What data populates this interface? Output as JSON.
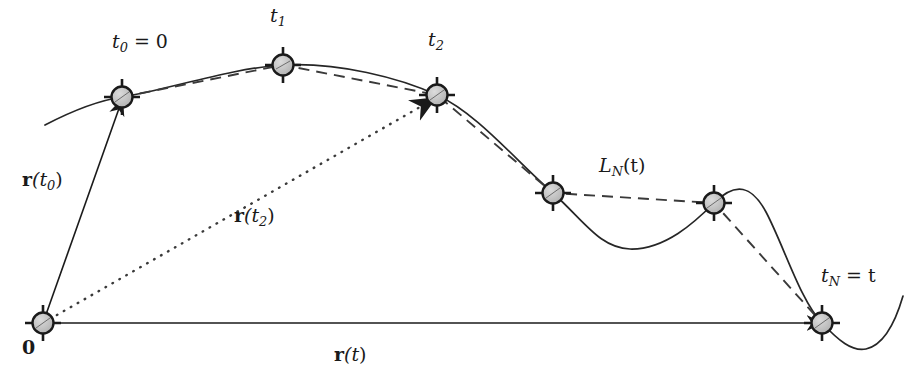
{
  "figure": {
    "type": "vector-trajectory-diagram",
    "canvas": {
      "width": 908,
      "height": 378
    },
    "colors": {
      "curve": "#262626",
      "dashed": "#3a3a3a",
      "dotted": "#3a3a3a",
      "node_fill": "#c0c0c0",
      "node_ring": "#1a1a1a",
      "text": "#1a1a1a",
      "background": "#ffffff"
    },
    "nodes": [
      {
        "name": "origin",
        "x": 43,
        "y": 323,
        "label": "0"
      },
      {
        "name": "t0",
        "x": 122,
        "y": 97,
        "label": "t0 = 0"
      },
      {
        "name": "t1",
        "x": 283,
        "y": 65,
        "label": "t1"
      },
      {
        "name": "t2",
        "x": 437,
        "y": 95,
        "label": "t2"
      },
      {
        "name": "t3",
        "x": 553,
        "y": 193,
        "label": ""
      },
      {
        "name": "t4",
        "x": 714,
        "y": 203,
        "label": ""
      },
      {
        "name": "tN",
        "x": 822,
        "y": 323,
        "label": "tN = t"
      }
    ],
    "vectors": [
      {
        "name": "r-t0",
        "style": "solid",
        "from": "origin",
        "to": "t0",
        "label": "r(t0)"
      },
      {
        "name": "r-t2",
        "style": "dotted",
        "from": "origin",
        "to": "t2",
        "label": "r(t2)"
      },
      {
        "name": "r-t",
        "style": "solid",
        "from": "origin",
        "to": "tN",
        "label": "r(t)"
      }
    ],
    "polyline": {
      "name": "L_N(t)",
      "style": "dashed",
      "label": "LN(t)",
      "through": [
        "t0",
        "t1",
        "t2",
        "t3",
        "t4",
        "tN"
      ]
    },
    "labels": {
      "t0": {
        "base": "t",
        "sub": "0",
        "eq": " = 0",
        "x": 112,
        "y": 32
      },
      "t1": {
        "base": "t",
        "sub": "1",
        "eq": "",
        "x": 270,
        "y": 6
      },
      "t2": {
        "base": "t",
        "sub": "2",
        "eq": "",
        "x": 428,
        "y": 30
      },
      "tN": {
        "base": "t",
        "sub": "N",
        "eq": " = t",
        "x": 821,
        "y": 266
      },
      "LN": {
        "base": "L",
        "sub": "N",
        "eq": "(t)",
        "x": 599,
        "y": 156
      },
      "r_t0": {
        "base": "r",
        "arg": "(t",
        "sub": "0",
        "close": ")",
        "x": 22,
        "y": 170
      },
      "r_t2": {
        "base": "r",
        "arg": "(t",
        "sub": "2",
        "close": ")",
        "x": 234,
        "y": 206
      },
      "r_t": {
        "base": "r",
        "arg": "(t",
        "sub": "",
        "close": ")",
        "x": 334,
        "y": 345
      },
      "zero": {
        "text": "0",
        "x": 22,
        "y": 338
      }
    }
  }
}
